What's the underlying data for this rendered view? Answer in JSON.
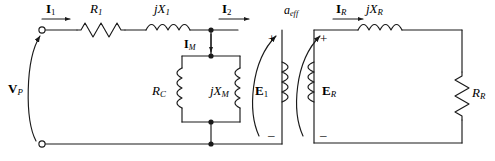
{
  "figure": {
    "type": "circuit-diagram",
    "background_color": "#ffffff",
    "line_color": "#1a1a1a"
  },
  "labels": {
    "source_voltage": "V",
    "source_voltage_sub": "P",
    "primary_current": "I",
    "primary_current_sub": "1",
    "series_resistance": "R",
    "series_resistance_sub": "1",
    "series_reactance": "jX",
    "series_reactance_sub": "1",
    "secondary_current": "I",
    "secondary_current_sub": "2",
    "magnetizing_current": "I",
    "magnetizing_current_sub": "M",
    "core_loss_resistance": "R",
    "core_loss_resistance_sub": "C",
    "magnetizing_reactance": "jX",
    "magnetizing_reactance_sub": "M",
    "induced_emf_primary": "E",
    "induced_emf_primary_sub": "1",
    "turns_ratio": "a",
    "turns_ratio_sub": "eff",
    "load_current": "I",
    "load_current_sub": "R",
    "load_reactance": "jX",
    "load_reactance_sub": "R",
    "induced_emf_secondary": "E",
    "induced_emf_secondary_sub": "R",
    "load_resistance": "R",
    "load_resistance_sub": "R",
    "plus_sign": "+",
    "minus_sign": "–"
  },
  "components": [
    {
      "name": "source-terminal-top",
      "kind": "open-terminal"
    },
    {
      "name": "source-terminal-bottom",
      "kind": "open-terminal"
    },
    {
      "name": "source-voltage-arrow",
      "kind": "curved-arrow-up"
    },
    {
      "name": "resistor-r1",
      "kind": "resistor-horizontal"
    },
    {
      "name": "inductor-jx1",
      "kind": "inductor-horizontal"
    },
    {
      "name": "coil-rc",
      "kind": "coil-vertical"
    },
    {
      "name": "coil-jxm",
      "kind": "coil-vertical"
    },
    {
      "name": "transformer-coil-primary",
      "kind": "coil-vertical"
    },
    {
      "name": "transformer-coil-secondary",
      "kind": "coil-vertical"
    },
    {
      "name": "emf-e1-arrow",
      "kind": "curved-arrow-up"
    },
    {
      "name": "emf-er-arrow",
      "kind": "curved-arrow-up"
    },
    {
      "name": "inductor-jxr",
      "kind": "inductor-horizontal"
    },
    {
      "name": "resistor-rr",
      "kind": "resistor-vertical"
    },
    {
      "name": "current-arrow-i1",
      "kind": "arrow-right"
    },
    {
      "name": "current-arrow-i2",
      "kind": "arrow-right"
    },
    {
      "name": "current-arrow-im",
      "kind": "arrow-down"
    },
    {
      "name": "current-arrow-ir",
      "kind": "arrow-right"
    },
    {
      "name": "node-dot-top",
      "kind": "junction-dot"
    },
    {
      "name": "node-dot-bottom",
      "kind": "junction-dot"
    },
    {
      "name": "node-dot-branch-top",
      "kind": "junction-dot"
    },
    {
      "name": "node-dot-branch-bottom",
      "kind": "junction-dot"
    }
  ]
}
